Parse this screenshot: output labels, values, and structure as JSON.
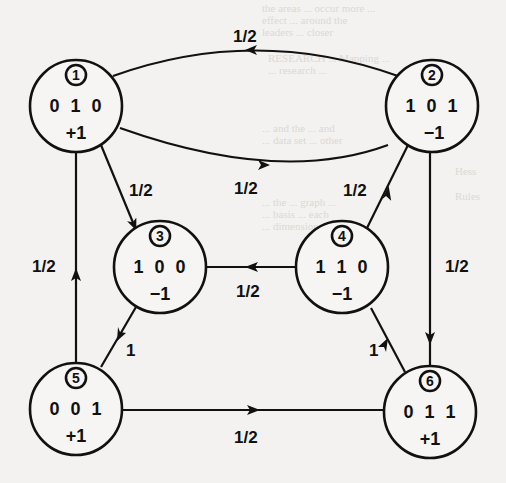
{
  "diagram": {
    "type": "state-transition-graph",
    "nodes": [
      {
        "id": "1",
        "id_label": "1",
        "state": "0 1 0",
        "value": "+1",
        "cx": 76,
        "cy": 106
      },
      {
        "id": "2",
        "id_label": "2",
        "state": "1 0 1",
        "value": "−1",
        "cx": 432,
        "cy": 106
      },
      {
        "id": "3",
        "id_label": "3",
        "state": "1 0 0",
        "value": "−1",
        "cx": 160,
        "cy": 267
      },
      {
        "id": "4",
        "id_label": "4",
        "state": "1 1 0",
        "value": "−1",
        "cx": 342,
        "cy": 267
      },
      {
        "id": "5",
        "id_label": "5",
        "state": "0 0 1",
        "value": "+1",
        "cx": 76,
        "cy": 409
      },
      {
        "id": "6",
        "id_label": "6",
        "state": "0 1 1",
        "value": "+1",
        "cx": 430,
        "cy": 412
      }
    ],
    "edges": [
      {
        "from": "2",
        "to": "1",
        "label": "1/2"
      },
      {
        "from": "1",
        "to": "2",
        "label": "1/2"
      },
      {
        "from": "1",
        "to": "3",
        "label": "1/2"
      },
      {
        "from": "2",
        "to": "6",
        "label": "1/2"
      },
      {
        "from": "4",
        "to": "2",
        "label": "1/2"
      },
      {
        "from": "4",
        "to": "3",
        "label": "1/2"
      },
      {
        "from": "5",
        "to": "1",
        "label": "1/2"
      },
      {
        "from": "3",
        "to": "5",
        "label": "1"
      },
      {
        "from": "6",
        "to": "4",
        "label": "1"
      },
      {
        "from": "5",
        "to": "6",
        "label": "1/2"
      }
    ]
  },
  "colors": {
    "ink": "#111111",
    "paper": "#f3f2f0"
  }
}
